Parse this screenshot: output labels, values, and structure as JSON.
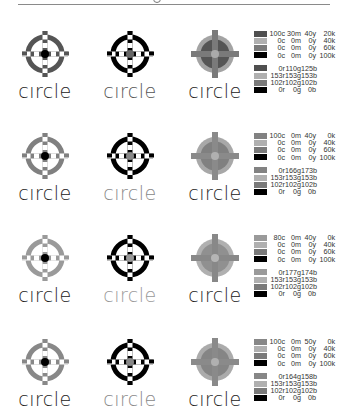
{
  "header": {
    "decorative_glyph": "circle-mark"
  },
  "wordmark": "circle",
  "rows": [
    {
      "ring_color": "#4f4f4f",
      "mark_color": "#000000",
      "logos": [
        {
          "variant": "color-ring",
          "ring": "#555555",
          "center": "#000000",
          "text": "#222222"
        },
        {
          "variant": "black-ring",
          "ring": "#000000",
          "center": "#666666",
          "text": "#555555"
        },
        {
          "variant": "filled",
          "outer": "#a3a3a3",
          "inner": "#555555",
          "cross": "#7a7a7a",
          "center": "#aaaaaa",
          "text": "#222222"
        }
      ],
      "legend": {
        "cmyk": [
          {
            "swatch": "#4f4f4f",
            "c": "100c",
            "m": "30m",
            "y": "40y",
            "k": "20k"
          },
          {
            "swatch": "#b0b0b0",
            "c": "0c",
            "m": "0m",
            "y": "0y",
            "k": "40k"
          },
          {
            "swatch": "#7a7a7a",
            "c": "0c",
            "m": "0m",
            "y": "0y",
            "k": "60k"
          },
          {
            "swatch": "#000000",
            "c": "0c",
            "m": "0m",
            "y": "0y",
            "k": "100k"
          }
        ],
        "rgb": [
          {
            "swatch": "#4f4f4f",
            "r": "0r",
            "g": "110g",
            "b": "125b"
          },
          {
            "swatch": "#b0b0b0",
            "r": "153r",
            "g": "153g",
            "b": "153b"
          },
          {
            "swatch": "#7a7a7a",
            "r": "102r",
            "g": "102g",
            "b": "102b"
          },
          {
            "swatch": "#000000",
            "r": "0r",
            "g": "0g",
            "b": "0b"
          }
        ]
      }
    },
    {
      "logos": [
        {
          "variant": "color-ring",
          "ring": "#808080",
          "center": "#000000",
          "text": "#222222"
        },
        {
          "variant": "black-ring",
          "ring": "#000000",
          "center": "#888888",
          "text": "#888888"
        },
        {
          "variant": "filled",
          "outer": "#a8a8a8",
          "inner": "#808080",
          "cross": "#8a8a8a",
          "center": "#b0b0b0",
          "text": "#222222"
        }
      ],
      "legend": {
        "cmyk": [
          {
            "swatch": "#828282",
            "c": "100c",
            "m": "0m",
            "y": "40y",
            "k": "0k"
          },
          {
            "swatch": "#b0b0b0",
            "c": "0c",
            "m": "0m",
            "y": "0y",
            "k": "40k"
          },
          {
            "swatch": "#7a7a7a",
            "c": "0c",
            "m": "0m",
            "y": "0y",
            "k": "60k"
          },
          {
            "swatch": "#000000",
            "c": "0c",
            "m": "0m",
            "y": "0y",
            "k": "100k"
          }
        ],
        "rgb": [
          {
            "swatch": "#828282",
            "r": "0r",
            "g": "166g",
            "b": "173b"
          },
          {
            "swatch": "#b0b0b0",
            "r": "153r",
            "g": "153g",
            "b": "153b"
          },
          {
            "swatch": "#7a7a7a",
            "r": "102r",
            "g": "102g",
            "b": "102b"
          },
          {
            "swatch": "#000000",
            "r": "0r",
            "g": "0g",
            "b": "0b"
          }
        ]
      }
    },
    {
      "logos": [
        {
          "variant": "color-ring",
          "ring": "#9a9a9a",
          "center": "#000000",
          "text": "#222222"
        },
        {
          "variant": "black-ring",
          "ring": "#000000",
          "center": "#999999",
          "text": "#999999"
        },
        {
          "variant": "filled",
          "outer": "#b0b0b0",
          "inner": "#909090",
          "cross": "#888888",
          "center": "#b5b5b5",
          "text": "#222222"
        }
      ],
      "legend": {
        "cmyk": [
          {
            "swatch": "#9a9a9a",
            "c": "80c",
            "m": "0m",
            "y": "40y",
            "k": "0k"
          },
          {
            "swatch": "#b0b0b0",
            "c": "0c",
            "m": "0m",
            "y": "0y",
            "k": "40k"
          },
          {
            "swatch": "#7a7a7a",
            "c": "0c",
            "m": "0m",
            "y": "0y",
            "k": "60k"
          },
          {
            "swatch": "#000000",
            "c": "0c",
            "m": "0m",
            "y": "0y",
            "k": "100k"
          }
        ],
        "rgb": [
          {
            "swatch": "#9a9a9a",
            "r": "0r",
            "g": "177g",
            "b": "174b"
          },
          {
            "swatch": "#b0b0b0",
            "r": "153r",
            "g": "153g",
            "b": "153b"
          },
          {
            "swatch": "#7a7a7a",
            "r": "102r",
            "g": "102g",
            "b": "102b"
          },
          {
            "swatch": "#000000",
            "r": "0r",
            "g": "0g",
            "b": "0b"
          }
        ]
      }
    },
    {
      "logos": [
        {
          "variant": "color-ring",
          "ring": "#888888",
          "center": "#000000",
          "text": "#222222"
        },
        {
          "variant": "black-ring",
          "ring": "#000000",
          "center": "#888888",
          "text": "#888888"
        },
        {
          "variant": "filled",
          "outer": "#ababab",
          "inner": "#858585",
          "cross": "#8a8a8a",
          "center": "#b0b0b0",
          "text": "#222222"
        }
      ],
      "legend": {
        "cmyk": [
          {
            "swatch": "#878787",
            "c": "100c",
            "m": "0m",
            "y": "50y",
            "k": "0k"
          },
          {
            "swatch": "#b0b0b0",
            "c": "0c",
            "m": "0m",
            "y": "0y",
            "k": "40k"
          },
          {
            "swatch": "#7a7a7a",
            "c": "0c",
            "m": "0m",
            "y": "0y",
            "k": "60k"
          },
          {
            "swatch": "#000000",
            "c": "0c",
            "m": "0m",
            "y": "0y",
            "k": "100k"
          }
        ],
        "rgb": [
          {
            "swatch": "#878787",
            "r": "0r",
            "g": "164g",
            "b": "158b"
          },
          {
            "swatch": "#b0b0b0",
            "r": "153r",
            "g": "153g",
            "b": "153b"
          },
          {
            "swatch": "#7a7a7a",
            "r": "102r",
            "g": "102g",
            "b": "102b"
          },
          {
            "swatch": "#000000",
            "r": "0r",
            "g": "0g",
            "b": "0b"
          }
        ]
      }
    }
  ]
}
